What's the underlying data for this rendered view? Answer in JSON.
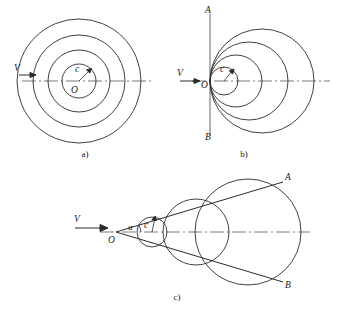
{
  "figure": {
    "stroke_color": "#2b2b2b",
    "axis_color": "#555555",
    "background": "#ffffff",
    "panels": [
      {
        "id": "a",
        "caption": "a)",
        "description": "Source at rest: concentric circular wavefronts",
        "velocity_label": "V",
        "center_label": "O",
        "radius_label": "c",
        "circle_count": 4,
        "center": {
          "x": 79,
          "y": 81
        },
        "radii": [
          17,
          31,
          46,
          62
        ]
      },
      {
        "id": "b",
        "caption": "b)",
        "description": "Source at sonic speed: wavefronts tangent at O, forming plane front A-B",
        "velocity_label": "V",
        "origin_label": "O",
        "radius_label": "c",
        "front_top_label": "A",
        "front_bottom_label": "B",
        "circle_count": 4,
        "origin": {
          "x": 210,
          "y": 81
        },
        "radii": [
          14,
          26,
          39,
          52
        ]
      },
      {
        "id": "c",
        "caption": "c)",
        "description": "Source at supersonic speed: Mach cone with half-angle alpha",
        "velocity_label": "V",
        "apex_label": "O",
        "radius_label": "c",
        "angle_label": "α",
        "cone_top_label": "A",
        "cone_bottom_label": "B",
        "circle_count": 3,
        "apex": {
          "x": 116,
          "y": 232
        },
        "mach_angle_degrees": 24,
        "circles": [
          {
            "cx": 152,
            "cy": 232,
            "r": 15
          },
          {
            "cx": 196,
            "cy": 232,
            "r": 33
          },
          {
            "cx": 248,
            "cy": 232,
            "r": 53
          }
        ]
      }
    ]
  }
}
